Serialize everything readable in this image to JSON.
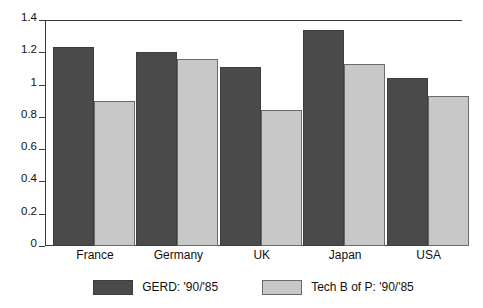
{
  "chart_data": {
    "type": "bar",
    "title": "",
    "subtitle": "",
    "xlabel": "",
    "ylabel": "",
    "categories": [
      "France",
      "Germany",
      "UK",
      "Japan",
      "USA"
    ],
    "series": [
      {
        "name": "GERD: '90/'85",
        "color": "#4a4a4a",
        "values": [
          1.23,
          1.2,
          1.11,
          1.34,
          1.04
        ]
      },
      {
        "name": "Tech B of P: '90/'85",
        "color": "#c8c8c8",
        "values": [
          0.9,
          1.16,
          0.84,
          1.13,
          0.93
        ]
      }
    ],
    "ylim": [
      0,
      1.4
    ],
    "yticks": [
      0,
      0.2,
      0.4,
      0.6,
      0.8,
      1.0,
      1.2,
      1.4
    ],
    "ytick_labels": [
      "0",
      "0.2",
      "0.4",
      "0.6",
      "0.8",
      "1",
      "1.2",
      "1.4"
    ],
    "grid": false,
    "legend_position": "bottom",
    "bar_grouping": "grouped"
  },
  "axes": {
    "y_tick_labels": [
      "0",
      "0.2",
      "0.4",
      "0.6",
      "0.8",
      "1",
      "1.2",
      "1.4"
    ],
    "x_tick_labels": [
      "France",
      "Germany",
      "UK",
      "Japan",
      "USA"
    ]
  },
  "legend": {
    "entries": [
      {
        "label": "GERD: '90/'85",
        "color": "#4a4a4a"
      },
      {
        "label": "Tech B of P: '90/'85",
        "color": "#c8c8c8"
      }
    ]
  },
  "colors": {
    "series_dark": "#4a4a4a",
    "series_light": "#c8c8c8",
    "axis": "#3a3a3a",
    "background": "#ffffff",
    "text": "#111111"
  }
}
